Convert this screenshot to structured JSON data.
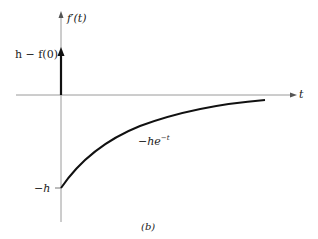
{
  "figure": {
    "caption": "(b)",
    "y_axis_label": "f′(t)",
    "x_axis_label": "t",
    "impulse_label": "h − f(0)",
    "curve_label_base": "−he",
    "curve_label_exp": "−t",
    "min_value_label": "−h",
    "colors": {
      "axis": "#9a9a9a",
      "curve": "#111111",
      "impulse": "#111111"
    }
  }
}
